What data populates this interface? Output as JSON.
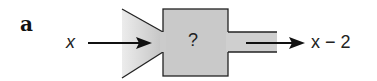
{
  "diagram": {
    "type": "function-machine",
    "part_label": "a",
    "input": "x",
    "operation": "?",
    "output": "x − 2",
    "colors": {
      "machine_fill_light": "#f2f2f2",
      "machine_fill_dark": "#bdbdbd",
      "stroke": "#222222"
    }
  }
}
